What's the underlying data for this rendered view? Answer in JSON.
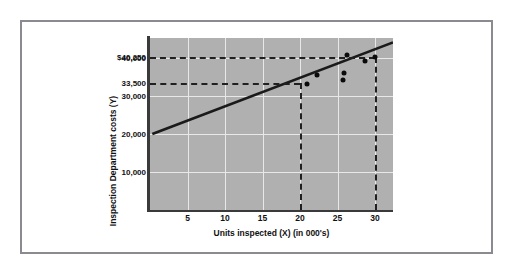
{
  "chart_data": {
    "type": "scatter",
    "title": "",
    "xlabel": "Units inspected (X) (in 000's)",
    "ylabel": "Inspection Department costs (Y)",
    "xlim": [
      0,
      32.4
    ],
    "ylim": [
      0,
      45263
    ],
    "grid": true,
    "legend": null,
    "x_ticks": [
      {
        "value": 5,
        "label": "5"
      },
      {
        "value": 10,
        "label": "10"
      },
      {
        "value": 15,
        "label": "15"
      },
      {
        "value": 20,
        "label": "20"
      },
      {
        "value": 25,
        "label": "25"
      },
      {
        "value": 30,
        "label": "30"
      }
    ],
    "y_ticks": [
      {
        "value": 40250,
        "label": "$40,250"
      },
      {
        "value": 40000,
        "label": "40,000"
      },
      {
        "value": 33500,
        "label": "33,500"
      },
      {
        "value": 30000,
        "label": "30,000"
      },
      {
        "value": 20000,
        "label": "20,000"
      },
      {
        "value": 10000,
        "label": "10,000"
      }
    ],
    "y_gridlines": [
      10000,
      20000,
      30000,
      40000
    ],
    "x_gridlines": [
      5,
      10,
      15,
      20,
      25,
      30
    ],
    "points": [
      {
        "x": 20.9,
        "y": 33200
      },
      {
        "x": 22.2,
        "y": 35600
      },
      {
        "x": 25.7,
        "y": 34300
      },
      {
        "x": 25.8,
        "y": 36100
      },
      {
        "x": 26.3,
        "y": 40900
      },
      {
        "x": 28.6,
        "y": 39100
      },
      {
        "x": 30.0,
        "y": 40250
      }
    ],
    "trend_line": {
      "label": "regression line",
      "x_start": 0.3,
      "y_start": 20000,
      "x_end": 32.4,
      "y_end": 44100,
      "intercept": 19800,
      "slope_per_1000_units": 750
    },
    "annotations": [
      {
        "name": "guide-h-40250",
        "type": "dashed-horizontal",
        "y": 40250,
        "x_from": 0.0,
        "x_to": 30.0
      },
      {
        "name": "guide-h-33500",
        "type": "dashed-horizontal",
        "y": 33500,
        "x_from": 0.0,
        "x_to": 20.0
      },
      {
        "name": "guide-v-20",
        "type": "dashed-vertical",
        "x": 20.0,
        "y_from": 0,
        "y_to": 33500
      },
      {
        "name": "guide-v-30",
        "type": "dashed-vertical",
        "x": 30.0,
        "y_from": 0,
        "y_to": 40250
      }
    ]
  },
  "colors": {
    "plot_background": "#b0b0b0",
    "gridline": "#e8e8e8",
    "axis": "#3a3a3a",
    "point": "#0a0a0a",
    "trend_line": "#1a1a1a",
    "dashed_guide": "#202020",
    "outer_frame": "#8a8a90",
    "page_background": "#ffffff",
    "text": "#111111"
  }
}
